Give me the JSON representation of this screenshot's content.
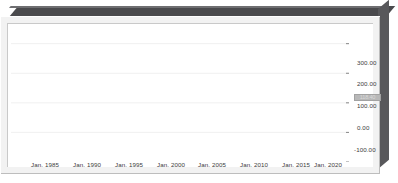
{
  "chart_data": {
    "type": "line",
    "title": "",
    "subtitle": "",
    "xlabel": "",
    "ylabel": "",
    "grid": true,
    "legend_position": "none",
    "xlim": [
      "Jan. 1982",
      "Jan. 2022"
    ],
    "ylim": [
      -100.0,
      380.0
    ],
    "ytick_labels": [
      "300.00",
      "200.00",
      "100.00",
      "0.00",
      "-100.00"
    ],
    "ytick_values": [
      300.0,
      200.0,
      100.0,
      0.0,
      -100.0
    ],
    "xtick_labels": [
      "Jan. 1985",
      "Jan. 1990",
      "Jan. 1995",
      "Jan. 2000",
      "Jan. 2005",
      "Jan. 2010",
      "Jan. 2015",
      "Jan. 2020"
    ],
    "xtick_values": [
      1985,
      1990,
      1995,
      2000,
      2005,
      2010,
      2015,
      2020
    ],
    "line_color": "#151515",
    "gridline_color": "#ececec",
    "series": [
      {
        "name": "Series 1",
        "x": [
          1982.0,
          1982.6,
          1983.2,
          1983.8,
          1984.4,
          1985.0,
          1985.6,
          1986.2,
          1986.8,
          1987.4,
          1988.0,
          1988.6,
          1989.2,
          1989.8,
          1990.4,
          1991.0,
          1991.6,
          1992.2,
          1992.8,
          1993.4,
          1994.0,
          1994.6,
          1995.2,
          1995.8,
          1996.4,
          1997.0,
          1997.6,
          1998.2,
          1998.8,
          1999.4,
          2000.0,
          2000.6,
          2001.2,
          2001.8,
          2002.4,
          2003.0,
          2003.6,
          2004.2,
          2004.8,
          2005.4,
          2006.0,
          2006.6,
          2007.2,
          2007.8,
          2008.4,
          2009.0,
          2009.6,
          2010.2,
          2010.8,
          2011.4,
          2012.0,
          2012.6,
          2013.2,
          2013.8,
          2014.4,
          2015.0,
          2015.6,
          2016.2,
          2016.8,
          2017.4,
          2018.0,
          2018.6,
          2019.2,
          2019.8,
          2020.1,
          2020.4,
          2020.7,
          2021.0,
          2021.3,
          2021.6,
          2021.9,
          2022.0
        ],
        "y": [
          3.0,
          1.5,
          0.5,
          2.0,
          4.0,
          5.0,
          4.0,
          3.0,
          5.0,
          9.0,
          11.0,
          10.0,
          12.0,
          14.0,
          13.0,
          11.0,
          14.0,
          18.0,
          22.0,
          25.0,
          29.0,
          32.0,
          30.0,
          28.0,
          31.0,
          35.0,
          39.0,
          44.0,
          48.0,
          53.0,
          58.0,
          51.0,
          45.0,
          48.0,
          43.0,
          40.0,
          44.0,
          50.0,
          54.0,
          48.0,
          44.0,
          48.0,
          52.0,
          58.0,
          63.0,
          70.0,
          66.0,
          58.0,
          50.0,
          54.0,
          62.0,
          70.0,
          66.0,
          71.0,
          76.0,
          72.0,
          82.0,
          108.0,
          116.0,
          108.0,
          124.0,
          114.0,
          122.0,
          134.0,
          160.0,
          200.0,
          268.0,
          310.0,
          345.0,
          318.0,
          300.0,
          118.0
        ]
      }
    ]
  },
  "y_axis": {
    "ticks": [
      {
        "label": "300.00",
        "top": 53
      },
      {
        "label": "200.00",
        "top": 74
      },
      {
        "label": "100.00",
        "top": 96
      },
      {
        "label": "0.00",
        "top": 118
      },
      {
        "label": "-100.00",
        "top": 140
      }
    ]
  },
  "x_axis": {
    "ticks": [
      {
        "label": "Jan. 1985",
        "left": 31
      },
      {
        "label": "Jan. 1990",
        "left": 73
      },
      {
        "label": "Jan. 1995",
        "left": 115
      },
      {
        "label": "Jan. 2000",
        "left": 157
      },
      {
        "label": "Jan. 2005",
        "left": 198
      },
      {
        "label": "Jan. 2010",
        "left": 240
      },
      {
        "label": "Jan. 2015",
        "left": 282
      },
      {
        "label": "Jan. 2020",
        "left": 314
      }
    ]
  },
  "value_marker": {
    "label": "118.40"
  }
}
